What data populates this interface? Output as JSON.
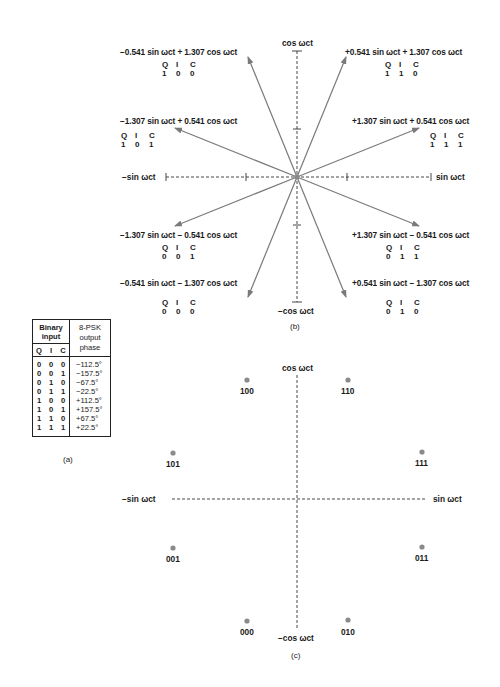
{
  "figure_b": {
    "caption": "(b)",
    "axes": {
      "pos_cos": "cos ωct",
      "neg_cos": "−cos ωct",
      "pos_sin": "sin ωct",
      "neg_sin": "−sin ωct"
    },
    "phasors": [
      {
        "id": "100",
        "expr": "−0.541 sin ωct + 1.307 cos ωct",
        "q": "1",
        "i": "0",
        "c": "0"
      },
      {
        "id": "110",
        "expr": "+0.541 sin ωct + 1.307 cos ωct",
        "q": "1",
        "i": "1",
        "c": "0"
      },
      {
        "id": "101",
        "expr": "−1.307 sin ωct + 0.541 cos ωct",
        "q": "1",
        "i": "0",
        "c": "1"
      },
      {
        "id": "111",
        "expr": "+1.307 sin ωct + 0.541 cos ωct",
        "q": "1",
        "i": "1",
        "c": "1"
      },
      {
        "id": "001",
        "expr": "−1.307 sin ωct − 0.541 cos ωct",
        "q": "0",
        "i": "0",
        "c": "1"
      },
      {
        "id": "011",
        "expr": "+1.307 sin ωct − 0.541 cos ωct",
        "q": "0",
        "i": "1",
        "c": "1"
      },
      {
        "id": "000",
        "expr": "−0.541 sin ωct − 1.307 cos ωct",
        "q": "0",
        "i": "0",
        "c": "0"
      },
      {
        "id": "010",
        "expr": "+0.541 sin ωct − 1.307 cos ωct",
        "q": "0",
        "i": "1",
        "c": "0"
      }
    ],
    "qic_headers": {
      "q": "Q",
      "i": "I",
      "c": "C"
    }
  },
  "figure_a": {
    "caption": "(a)",
    "header_input": "Binary input",
    "header_input_line1": "Binary",
    "header_input_line2": "input",
    "header_output_line1": "8-PSK",
    "header_output_line2": "output",
    "header_output_line3": "phase",
    "col_q": "Q",
    "col_i": "I",
    "col_c": "C",
    "rows": [
      {
        "q": "0",
        "i": "0",
        "c": "0",
        "phase": "−112.5°"
      },
      {
        "q": "0",
        "i": "0",
        "c": "1",
        "phase": "−157.5°"
      },
      {
        "q": "0",
        "i": "1",
        "c": "0",
        "phase": "−67.5°"
      },
      {
        "q": "0",
        "i": "1",
        "c": "1",
        "phase": "−22.5°"
      },
      {
        "q": "1",
        "i": "0",
        "c": "0",
        "phase": "+112.5°"
      },
      {
        "q": "1",
        "i": "0",
        "c": "1",
        "phase": "+157.5°"
      },
      {
        "q": "1",
        "i": "1",
        "c": "0",
        "phase": "+67.5°"
      },
      {
        "q": "1",
        "i": "1",
        "c": "1",
        "phase": "+22.5°"
      }
    ]
  },
  "figure_c": {
    "caption": "(c)",
    "axes": {
      "pos_cos": "cos ωct",
      "neg_cos": "−cos ωct",
      "pos_sin": "sin ωct",
      "neg_sin": "−sin ωct"
    },
    "points": [
      {
        "label": "100"
      },
      {
        "label": "110"
      },
      {
        "label": "101"
      },
      {
        "label": "111"
      },
      {
        "label": "001"
      },
      {
        "label": "011"
      },
      {
        "label": "000"
      },
      {
        "label": "010"
      }
    ]
  },
  "colors": {
    "ink": "#1a1a1a",
    "phasor": "#7a7a7a",
    "point": "#8a8a8a",
    "axis": "#333333"
  }
}
